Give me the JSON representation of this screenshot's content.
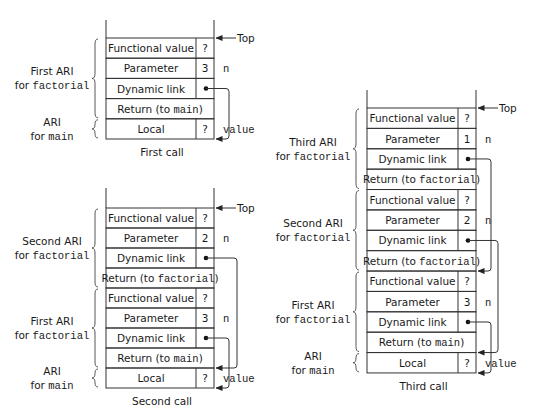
{
  "figure": {
    "stacks": [
      {
        "id": "first-call",
        "caption": "First call",
        "x": 106,
        "width": 108,
        "divider": 196,
        "wall_top": 20,
        "top": 38,
        "row_h": 20.2,
        "top_label": "Top",
        "rows": [
          {
            "kind": "split",
            "label": "Functional value",
            "value": "?"
          },
          {
            "kind": "split",
            "label": "Parameter",
            "value": "3",
            "side": "n"
          },
          {
            "kind": "split",
            "label": "Dynamic link",
            "value": "•",
            "link": true
          },
          {
            "kind": "full",
            "label": "Return (to ",
            "code": "main",
            "tail": ")"
          },
          {
            "kind": "split",
            "label": "Local",
            "value": "?",
            "side": "value"
          }
        ],
        "braces": [
          {
            "from": 0,
            "to": 4,
            "line1": "First ARI",
            "line2_pre": "for ",
            "line2_code": "factorial"
          },
          {
            "from": 4,
            "to": 5,
            "line1": "ARI",
            "line2_pre": "for ",
            "line2_code": "main"
          }
        ],
        "links": [
          {
            "from_row": 2,
            "to_row_edge": 5,
            "offset": 15
          }
        ]
      },
      {
        "id": "second-call",
        "caption": "Second call",
        "x": 106,
        "width": 108,
        "divider": 196,
        "wall_top": 188,
        "top": 208,
        "row_h": 20,
        "top_label": "Top",
        "rows": [
          {
            "kind": "split",
            "label": "Functional value",
            "value": "?"
          },
          {
            "kind": "split",
            "label": "Parameter",
            "value": "2",
            "side": "n"
          },
          {
            "kind": "split",
            "label": "Dynamic link",
            "value": "•",
            "link": true
          },
          {
            "kind": "full",
            "label": "Return (to ",
            "code": "factorial",
            "tail": ")"
          },
          {
            "kind": "split",
            "label": "Functional value",
            "value": "?"
          },
          {
            "kind": "split",
            "label": "Parameter",
            "value": "3",
            "side": "n"
          },
          {
            "kind": "split",
            "label": "Dynamic link",
            "value": "•",
            "link": true
          },
          {
            "kind": "full",
            "label": "Return (to ",
            "code": "main",
            "tail": ")"
          },
          {
            "kind": "split",
            "label": "Local",
            "value": "?",
            "side": "value"
          }
        ],
        "braces": [
          {
            "from": 0,
            "to": 4,
            "line1": "Second ARI",
            "line2_pre": "for ",
            "line2_code": "factorial"
          },
          {
            "from": 4,
            "to": 8,
            "line1": "First ARI",
            "line2_pre": "for ",
            "line2_code": "factorial"
          },
          {
            "from": 8,
            "to": 9,
            "line1": "ARI",
            "line2_pre": "for ",
            "line2_code": "main"
          }
        ],
        "links": [
          {
            "from_row": 2,
            "to_row_edge": 8,
            "offset": 23
          },
          {
            "from_row": 6,
            "to_row_edge": 9,
            "offset": 15
          }
        ]
      },
      {
        "id": "third-call",
        "caption": "Third call",
        "x": 367,
        "width": 109,
        "divider": 458,
        "wall_top": 90,
        "top": 108,
        "row_h": 20.38,
        "top_label": "Top",
        "rows": [
          {
            "kind": "split",
            "label": "Functional value",
            "value": "?"
          },
          {
            "kind": "split",
            "label": "Parameter",
            "value": "1",
            "side": "n"
          },
          {
            "kind": "split",
            "label": "Dynamic link",
            "value": "•",
            "link": true
          },
          {
            "kind": "full",
            "label": "Return (to ",
            "code": "factorial",
            "tail": ")"
          },
          {
            "kind": "split",
            "label": "Functional value",
            "value": "?"
          },
          {
            "kind": "split",
            "label": "Parameter",
            "value": "2",
            "side": "n"
          },
          {
            "kind": "split",
            "label": "Dynamic link",
            "value": "•",
            "link": true
          },
          {
            "kind": "full",
            "label": "Return (to ",
            "code": "factorial",
            "tail": ")"
          },
          {
            "kind": "split",
            "label": "Functional value",
            "value": "?"
          },
          {
            "kind": "split",
            "label": "Parameter",
            "value": "3",
            "side": "n"
          },
          {
            "kind": "split",
            "label": "Dynamic link",
            "value": "•",
            "link": true
          },
          {
            "kind": "full",
            "label": "Return (to ",
            "code": "main",
            "tail": ")"
          },
          {
            "kind": "split",
            "label": "Local",
            "value": "?",
            "side": "value"
          }
        ],
        "braces": [
          {
            "from": 0,
            "to": 4,
            "line1": "Third ARI",
            "line2_pre": "for ",
            "line2_code": "factorial"
          },
          {
            "from": 4,
            "to": 8,
            "line1": "Second ARI",
            "line2_pre": "for ",
            "line2_code": "factorial"
          },
          {
            "from": 8,
            "to": 12,
            "line1": "First ARI",
            "line2_pre": "for ",
            "line2_code": "factorial"
          },
          {
            "from": 12,
            "to": 13,
            "line1": "ARI",
            "line2_pre": "for ",
            "line2_code": "main"
          }
        ],
        "links": [
          {
            "from_row": 2,
            "to_row_edge": 8,
            "offset": 15
          },
          {
            "from_row": 6,
            "to_row_edge": 12,
            "offset": 22
          },
          {
            "from_row": 10,
            "to_row_edge": 13,
            "offset": 15
          }
        ]
      }
    ]
  }
}
